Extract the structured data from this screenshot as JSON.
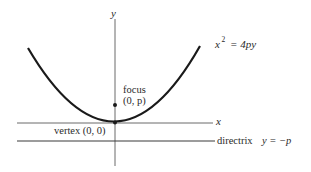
{
  "diagram": {
    "type": "parabola",
    "equation": {
      "base": "x",
      "exponent": "2",
      "rhs": "= 4py"
    },
    "axes": {
      "x_label": "x",
      "y_label": "y"
    },
    "focus": {
      "label": "focus",
      "coords": "(0, p)"
    },
    "vertex": {
      "label": "vertex (0, 0)"
    },
    "directrix": {
      "label": "directrix",
      "equation": "y = −p"
    },
    "colors": {
      "curve": "#1a1a1a",
      "axis": "#6b6b6b",
      "text": "#2a2a2a"
    }
  }
}
